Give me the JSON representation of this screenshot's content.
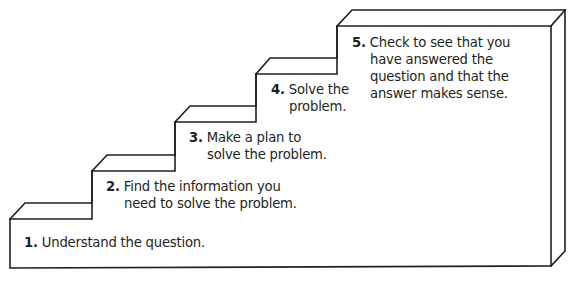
{
  "diagram": {
    "title": "",
    "type": "staircase",
    "colors": {
      "line": "#231f20",
      "background": "#ffffff",
      "text": "#231f20"
    },
    "steps": [
      {
        "number": "1.",
        "lines": [
          "Understand the question."
        ]
      },
      {
        "number": "2.",
        "lines": [
          "Find the information you",
          "need to solve the problem."
        ]
      },
      {
        "number": "3.",
        "lines": [
          "Make a plan to",
          "solve the problem."
        ]
      },
      {
        "number": "4.",
        "lines": [
          "Solve the",
          "problem."
        ]
      },
      {
        "number": "5.",
        "lines": [
          "Check to see that you",
          "have answered the",
          "question and that the",
          "answer makes sense."
        ]
      }
    ]
  }
}
